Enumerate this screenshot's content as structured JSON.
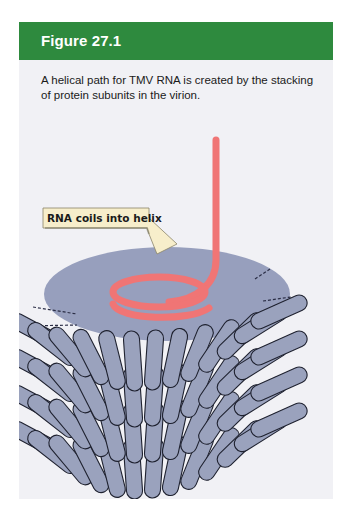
{
  "figure": {
    "title": "Figure 27.1",
    "caption": "A helical path for TMV RNA is created by the stacking of protein subunits in the virion.",
    "callout": "RNA coils into helix"
  },
  "colors": {
    "header_green": "#2e8a3e",
    "panel_bg": "#f1f1f5",
    "protein_fill": "#9aa2bd",
    "disc_fill": "#979fbd",
    "rna": "#f07575",
    "callout_bg": "#f7eecb"
  }
}
